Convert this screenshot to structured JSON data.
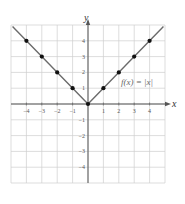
{
  "chart_data": {
    "type": "line",
    "title": "",
    "function_label": "f(x) = |x|",
    "xlabel": "x",
    "ylabel": "y",
    "xlim": [
      -5,
      5
    ],
    "ylim": [
      -5,
      5
    ],
    "grid": true,
    "x_ticks": [
      "-4",
      "-3",
      "-2",
      "-1",
      "1",
      "2",
      "3",
      "4"
    ],
    "y_ticks": [
      "4",
      "3",
      "2",
      "1",
      "-1",
      "-2",
      "-3",
      "-4"
    ],
    "series": [
      {
        "name": "f(x) = |x|",
        "x": [
          -4,
          -3,
          -2,
          -1,
          0,
          1,
          2,
          3,
          4
        ],
        "y": [
          4,
          3,
          2,
          1,
          0,
          1,
          2,
          3,
          4
        ]
      }
    ],
    "colors": {
      "line": "#6b6b6b",
      "points": "#111111",
      "grid": "#cfcfcf",
      "axis": "#555555"
    }
  }
}
